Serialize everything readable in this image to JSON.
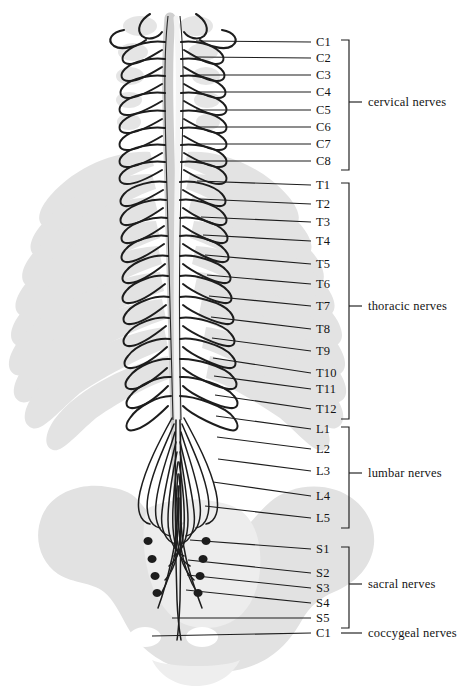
{
  "figure": {
    "colors": {
      "ink": "#141414",
      "skeleton_gray": "#e2e2e2",
      "skeleton_gray_dark": "#d4d4d4",
      "background": "#ffffff"
    }
  },
  "segments": [
    {
      "label": "C1",
      "y": 46,
      "root_x": 196,
      "root_y": 41
    },
    {
      "label": "C2",
      "y": 62,
      "root_x": 196,
      "root_y": 57
    },
    {
      "label": "C3",
      "y": 79,
      "root_x": 196,
      "root_y": 75
    },
    {
      "label": "C4",
      "y": 96,
      "root_x": 196,
      "root_y": 92
    },
    {
      "label": "C5",
      "y": 114,
      "root_x": 196,
      "root_y": 110
    },
    {
      "label": "C6",
      "y": 131,
      "root_x": 196,
      "root_y": 127
    },
    {
      "label": "C7",
      "y": 148,
      "root_x": 196,
      "root_y": 144
    },
    {
      "label": "C8",
      "y": 165,
      "root_x": 196,
      "root_y": 161
    },
    {
      "label": "T1",
      "y": 189,
      "root_x": 197,
      "root_y": 181
    },
    {
      "label": "T2",
      "y": 208,
      "root_x": 199,
      "root_y": 199
    },
    {
      "label": "T3",
      "y": 226,
      "root_x": 201,
      "root_y": 217
    },
    {
      "label": "T4",
      "y": 245,
      "root_x": 203,
      "root_y": 235
    },
    {
      "label": "T5",
      "y": 268,
      "root_x": 205,
      "root_y": 255
    },
    {
      "label": "T6",
      "y": 288,
      "root_x": 207,
      "root_y": 275
    },
    {
      "label": "T7",
      "y": 310,
      "root_x": 209,
      "root_y": 296
    },
    {
      "label": "T8",
      "y": 333,
      "root_x": 211,
      "root_y": 317
    },
    {
      "label": "T9",
      "y": 355,
      "root_x": 212,
      "root_y": 338
    },
    {
      "label": "T10",
      "y": 377,
      "root_x": 213,
      "root_y": 358
    },
    {
      "label": "T11",
      "y": 393,
      "root_x": 214,
      "root_y": 376
    },
    {
      "label": "T12",
      "y": 413,
      "root_x": 215,
      "root_y": 395
    },
    {
      "label": "L1",
      "y": 433,
      "root_x": 216,
      "root_y": 416
    },
    {
      "label": "L2",
      "y": 453,
      "root_x": 217,
      "root_y": 437
    },
    {
      "label": "L3",
      "y": 475,
      "root_x": 218,
      "root_y": 459
    },
    {
      "label": "L4",
      "y": 500,
      "root_x": 213,
      "root_y": 482
    },
    {
      "label": "L5",
      "y": 522,
      "root_x": 205,
      "root_y": 506
    },
    {
      "label": "S1",
      "y": 553,
      "root_x": 190,
      "root_y": 540
    },
    {
      "label": "S2",
      "y": 577,
      "root_x": 188,
      "root_y": 560
    },
    {
      "label": "S3",
      "y": 592,
      "root_x": 187,
      "root_y": 575
    },
    {
      "label": "S4",
      "y": 607,
      "root_x": 186,
      "root_y": 590
    },
    {
      "label": "S5",
      "y": 622,
      "root_x": 172,
      "root_y": 618
    },
    {
      "label": "C1",
      "y": 637,
      "root_x": 152,
      "root_y": 636
    }
  ],
  "groups": [
    {
      "label": "cervical nerves",
      "top": 40,
      "bottom": 170,
      "text_y": 106,
      "bracket": true
    },
    {
      "label": "thoracic nerves",
      "top": 183,
      "bottom": 419,
      "text_y": 310,
      "bracket": true
    },
    {
      "label": "lumbar nerves",
      "top": 427,
      "bottom": 528,
      "text_y": 477,
      "bracket": true
    },
    {
      "label": "sacral nerves",
      "top": 547,
      "bottom": 628,
      "text_y": 588,
      "bracket": true
    },
    {
      "label": "coccygeal nerves",
      "top": 637,
      "bottom": 637,
      "text_y": 637,
      "bracket": false
    }
  ],
  "geometry": {
    "label_x": 316,
    "leader_end_x": 311,
    "bracket_x": 349,
    "bracket_arm": 8,
    "group_tick_x": 357,
    "group_label_x": 368
  }
}
